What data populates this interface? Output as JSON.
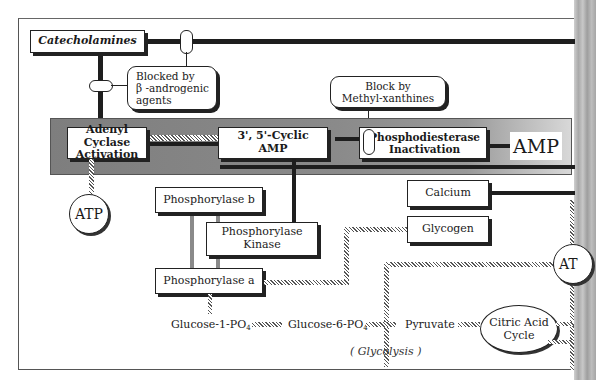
{
  "diagram": {
    "nodes": {
      "catecholamines": "Catecholamines",
      "blocked_beta_l1": "Blocked by",
      "blocked_beta_l2": "β -androgenic",
      "blocked_beta_l3": "agents",
      "block_methyl_l1": "Block by",
      "block_methyl_l2": "Methyl-xanthines",
      "adenyl_l1": "Adenyl Cyclase",
      "adenyl_l2": "Activation",
      "camp_l1": "3', 5'-Cyclic",
      "camp_l2": "AMP",
      "pde_l1": "Phosphodiesterase",
      "pde_l2": "Inactivation",
      "amp": "AMP",
      "atp": "ATP",
      "atp_right": "AT",
      "phosphorylase_b": "Phosphorylase b",
      "kinase_l1": "Phosphorylase",
      "kinase_l2": "Kinase",
      "phosphorylase_a": "Phosphorylase a",
      "calcium": "Calcium",
      "glycogen": "Glycogen",
      "glucose1": "Glucose-1-PO",
      "glucose1_sub": "4",
      "glucose6": "Glucose-6-PO",
      "glucose6_sub": "4",
      "pyruvate": "Pyruvate",
      "glycolysis": "( Glycolysis )",
      "citric_l1": "Citric Acid",
      "citric_l2": "Cycle"
    },
    "colors": {
      "line": "#1e1e1e",
      "band": "#8a8a8a",
      "background": "#ffffff"
    }
  }
}
